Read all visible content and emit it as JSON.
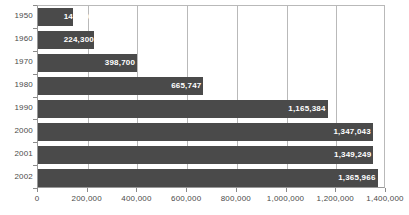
{
  "chart_data": {
    "type": "bar",
    "orientation": "horizontal",
    "title": "",
    "subtitle": "",
    "xlabel": "",
    "ylabel": "",
    "categories": [
      "1950",
      "1960",
      "1970",
      "1980",
      "1990",
      "2000",
      "2001",
      "2002"
    ],
    "values": [
      141600,
      224300,
      398700,
      665747,
      1165384,
      1347043,
      1349249,
      1365966
    ],
    "value_labels": [
      "141,600",
      "224,300",
      "398,700",
      "665,747",
      "1,165,384",
      "1,347,043",
      "1,349,249",
      "1,365,966"
    ],
    "xlim": [
      0,
      1400000
    ],
    "xticks": [
      0,
      200000,
      400000,
      600000,
      800000,
      1000000,
      1200000,
      1400000
    ],
    "xtick_labels": [
      "0",
      "200,000",
      "400,000",
      "600,000",
      "800,000",
      "1,000,000",
      "1,200,000",
      "1,400,000"
    ],
    "grid": true,
    "grid_axis": "x",
    "legend": false,
    "series": [
      {
        "name": "",
        "values": [
          141600,
          224300,
          398700,
          665747,
          1165384,
          1347043,
          1349249,
          1365966
        ]
      }
    ]
  },
  "style": {
    "bar_color": "#4a4a4a",
    "bar_label_color": "#ffffff",
    "grid_color": "#b9b9b9",
    "axis_color": "#8a8a8a",
    "tick_label_color": "#4a4a4a",
    "background": "#ffffff"
  }
}
